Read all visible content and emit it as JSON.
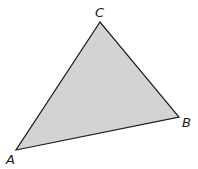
{
  "diagram": {
    "type": "triangle",
    "fill_color": "#d3d3d3",
    "stroke_color": "#1a1a1a",
    "vertices": {
      "A": {
        "label": "A",
        "x": 16,
        "y": 150
      },
      "B": {
        "label": "B",
        "x": 179,
        "y": 117
      },
      "C": {
        "label": "C",
        "x": 100,
        "y": 22
      }
    }
  }
}
